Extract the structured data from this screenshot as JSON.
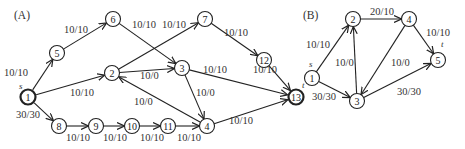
{
  "graphs": [
    {
      "id": "A",
      "panel_label": "(A)",
      "panel_pos": [
        14,
        19
      ],
      "radius": 7.5,
      "nodes": [
        {
          "id": "1",
          "x": 28,
          "y": 97,
          "bold": true,
          "tag": "s",
          "tag_dx": -9,
          "tag_dy": -8
        },
        {
          "id": "5",
          "x": 57,
          "y": 53
        },
        {
          "id": "6",
          "x": 113,
          "y": 19
        },
        {
          "id": "2",
          "x": 112,
          "y": 73
        },
        {
          "id": "7",
          "x": 205,
          "y": 19
        },
        {
          "id": "3",
          "x": 182,
          "y": 68
        },
        {
          "id": "12",
          "x": 264,
          "y": 60
        },
        {
          "id": "13",
          "x": 296,
          "y": 97,
          "bold": true,
          "tag": "t",
          "tag_dx": 6,
          "tag_dy": -9
        },
        {
          "id": "8",
          "x": 59,
          "y": 126
        },
        {
          "id": "9",
          "x": 96,
          "y": 126
        },
        {
          "id": "10",
          "x": 132,
          "y": 126
        },
        {
          "id": "11",
          "x": 168,
          "y": 126
        },
        {
          "id": "4",
          "x": 207,
          "y": 126
        }
      ],
      "edges": [
        {
          "from": "1",
          "to": "5",
          "label": "10/10",
          "lx": 4,
          "ly": 76
        },
        {
          "from": "5",
          "to": "6",
          "label": "10/10",
          "lx": 64,
          "ly": 33
        },
        {
          "from": "6",
          "to": "3",
          "label": "10/10",
          "lx": 132,
          "ly": 28
        },
        {
          "from": "1",
          "to": "2",
          "label": "10/10",
          "lx": 70,
          "ly": 96
        },
        {
          "from": "2",
          "to": "7",
          "label": "10/10",
          "lx": 162,
          "ly": 28
        },
        {
          "from": "2",
          "to": "3",
          "label": "10/0",
          "lx": 140,
          "ly": 79
        },
        {
          "from": "7",
          "to": "12",
          "label": "10/10",
          "lx": 224,
          "ly": 36
        },
        {
          "from": "12",
          "to": "13",
          "label": "10/10",
          "lx": 253,
          "ly": 73
        },
        {
          "from": "3",
          "to": "13",
          "label": "10/10",
          "lx": 203,
          "ly": 73
        },
        {
          "from": "3",
          "to": "4",
          "label": "10/0",
          "lx": 196,
          "ly": 96
        },
        {
          "from": "4",
          "to": "2",
          "label": "10/0",
          "lx": 134,
          "ly": 105
        },
        {
          "from": "1",
          "to": "8",
          "label": "30/30",
          "lx": 16,
          "ly": 118
        },
        {
          "from": "8",
          "to": "9",
          "label": "10/10",
          "lx": 66,
          "ly": 141
        },
        {
          "from": "9",
          "to": "10",
          "label": "10/10",
          "lx": 103,
          "ly": 141
        },
        {
          "from": "10",
          "to": "11",
          "label": "10/10",
          "lx": 140,
          "ly": 141
        },
        {
          "from": "11",
          "to": "4",
          "label": "10/10",
          "lx": 177,
          "ly": 141
        },
        {
          "from": "4",
          "to": "13",
          "label": "10/10",
          "lx": 229,
          "ly": 124
        }
      ]
    },
    {
      "id": "B",
      "panel_label": "(B)",
      "panel_pos": [
        303,
        19
      ],
      "radius": 7.5,
      "nodes": [
        {
          "id": "1",
          "x": 312,
          "y": 78,
          "tag": "s",
          "tag_dx": -3,
          "tag_dy": -11
        },
        {
          "id": "2",
          "x": 353,
          "y": 19
        },
        {
          "id": "4",
          "x": 409,
          "y": 19
        },
        {
          "id": "5",
          "x": 438,
          "y": 60,
          "tag": "t",
          "tag_dx": 3,
          "tag_dy": -13
        },
        {
          "id": "3",
          "x": 357,
          "y": 101
        }
      ],
      "edges": [
        {
          "from": "1",
          "to": "2",
          "label": "10/10",
          "lx": 306,
          "ly": 48
        },
        {
          "from": "2",
          "to": "4",
          "label": "20/10",
          "lx": 370,
          "ly": 15
        },
        {
          "from": "4",
          "to": "5",
          "label": "10/10",
          "lx": 426,
          "ly": 36
        },
        {
          "from": "1",
          "to": "3",
          "label": "30/30",
          "lx": 312,
          "ly": 100
        },
        {
          "from": "3",
          "to": "2",
          "label": "10/0",
          "lx": 335,
          "ly": 66
        },
        {
          "from": "4",
          "to": "3",
          "label": "10/0",
          "lx": 391,
          "ly": 66
        },
        {
          "from": "3",
          "to": "5",
          "label": "30/30",
          "lx": 397,
          "ly": 95
        }
      ]
    }
  ]
}
